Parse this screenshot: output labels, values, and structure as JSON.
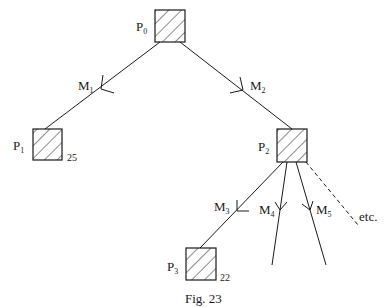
{
  "figure": {
    "caption": "Fig. 23",
    "nodes": [
      {
        "id": "P0",
        "base": "P",
        "sub": "0",
        "value": ""
      },
      {
        "id": "P1",
        "base": "P",
        "sub": "1",
        "value": "25"
      },
      {
        "id": "P2",
        "base": "P",
        "sub": "2",
        "value": ""
      },
      {
        "id": "P3",
        "base": "P",
        "sub": "3",
        "value": "22"
      }
    ],
    "edges": [
      {
        "id": "M1",
        "base": "M",
        "sub": "1",
        "from": "P0",
        "to": "P1"
      },
      {
        "id": "M2",
        "base": "M",
        "sub": "2",
        "from": "P0",
        "to": "P2"
      },
      {
        "id": "M3",
        "base": "M",
        "sub": "3",
        "from": "P2",
        "to": "P3"
      },
      {
        "id": "M4",
        "base": "M",
        "sub": "4",
        "from": "P2",
        "to": ""
      },
      {
        "id": "M5",
        "base": "M",
        "sub": "5",
        "from": "P2",
        "to": ""
      }
    ],
    "continuation_label": "etc."
  }
}
